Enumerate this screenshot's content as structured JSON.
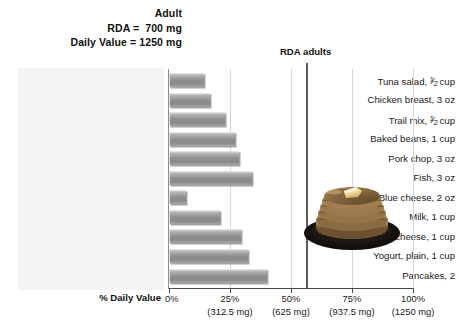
{
  "header": {
    "line1": "Adult",
    "line2": "RDA =  700 mg",
    "line3": "Daily Value = 1250 mg"
  },
  "rda_marker": {
    "label": "RDA adults",
    "value_percent": 56
  },
  "axis": {
    "title": "% Daily Value",
    "zero_label": "0%",
    "ticks": [
      {
        "percent": "25%",
        "mg": "(312.5 mg)",
        "value": 25
      },
      {
        "percent": "50%",
        "mg": "(625 mg)",
        "value": 50
      },
      {
        "percent": "75%",
        "mg": "(937.5 mg)",
        "value": 75
      },
      {
        "percent": "100%",
        "mg": "(1250 mg)",
        "value": 100
      }
    ]
  },
  "photo": {
    "name": "pancakes-photo",
    "alt": "Stack of pancakes with butter on a dark plate"
  },
  "chart_data": {
    "type": "bar",
    "orientation": "horizontal",
    "xlabel": "% Daily Value",
    "ylabel": "",
    "xlim": [
      0,
      100
    ],
    "grid": true,
    "legend": false,
    "units": "% Daily Value (1250 mg = 100%)",
    "reference_line": {
      "label": "RDA adults",
      "value": 56
    },
    "categories": [
      "Tuna salad, ½ cup",
      "Chicken breast, 3 oz",
      "Trail mix, ½ cup",
      "Baked beans, 1 cup",
      "Pork chop, 3 oz",
      "Fish, 3 oz",
      "Blue cheese, 2 oz",
      "Milk, 1 cup",
      "Cottage cheese, 1 cup",
      "Yogurt, plain, 1 cup",
      "Pancakes, 2"
    ],
    "values": [
      14.5,
      17,
      23,
      27,
      28.5,
      34,
      7,
      21,
      29.5,
      32.5,
      40
    ],
    "tick_labels_percent": [
      "0%",
      "25%",
      "50%",
      "75%",
      "100%"
    ],
    "tick_labels_mg": [
      "",
      "(312.5 mg)",
      "(625 mg)",
      "(937.5 mg)",
      "(1250 mg)"
    ]
  }
}
